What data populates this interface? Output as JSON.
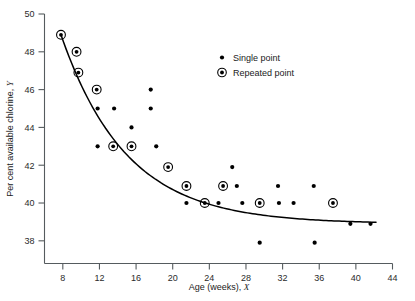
{
  "chart_data": {
    "type": "scatter",
    "title": "",
    "xlabel": "Age (weeks), X",
    "ylabel": "Per cent available chlorine, Y",
    "xlim": [
      6,
      44
    ],
    "ylim": [
      36.8,
      50
    ],
    "grid": false,
    "xticks": [
      8,
      12,
      16,
      20,
      24,
      28,
      32,
      36,
      40,
      44
    ],
    "yticks": [
      38,
      40,
      42,
      44,
      46,
      48,
      50
    ],
    "xticklabels": [
      "8",
      "12",
      "16",
      "20",
      "24",
      "28",
      "32",
      "36",
      "40",
      "44"
    ],
    "yticklabels": [
      "38",
      "40",
      "42",
      "44",
      "46",
      "48",
      "50"
    ],
    "legend": {
      "position": "upper-right-inside",
      "entries": [
        {
          "label": "Single point",
          "marker": "dot"
        },
        {
          "label": "Repeated point",
          "marker": "dot-in-circle"
        }
      ]
    },
    "series": [
      {
        "name": "Single point",
        "marker": "dot",
        "points": [
          [
            11.8,
            45.0
          ],
          [
            11.8,
            43.0
          ],
          [
            13.6,
            45.0
          ],
          [
            15.5,
            44.0
          ],
          [
            17.6,
            46.0
          ],
          [
            17.6,
            45.0
          ],
          [
            18.2,
            43.0
          ],
          [
            21.5,
            40.0
          ],
          [
            25.0,
            40.0
          ],
          [
            26.5,
            41.9
          ],
          [
            27.0,
            40.9
          ],
          [
            27.6,
            40.0
          ],
          [
            29.5,
            37.9
          ],
          [
            31.5,
            40.9
          ],
          [
            31.6,
            40.0
          ],
          [
            33.2,
            40.0
          ],
          [
            35.4,
            40.9
          ],
          [
            35.5,
            37.9
          ],
          [
            39.4,
            38.9
          ],
          [
            41.6,
            38.9
          ]
        ]
      },
      {
        "name": "Repeated point",
        "marker": "dot-in-circle",
        "points": [
          [
            7.8,
            48.9
          ],
          [
            9.5,
            48.0
          ],
          [
            9.7,
            46.9
          ],
          [
            11.7,
            46.0
          ],
          [
            13.5,
            43.0
          ],
          [
            15.5,
            43.0
          ],
          [
            19.5,
            41.9
          ],
          [
            21.5,
            40.9
          ],
          [
            23.5,
            40.0
          ],
          [
            25.5,
            40.9
          ],
          [
            29.5,
            40.0
          ],
          [
            37.5,
            40.0
          ]
        ]
      }
    ],
    "fit_curve": {
      "name": "fitted exponential curve",
      "model": "Y = 39.0 + 17.0 * exp(-0.14 * X)",
      "asymptote": 38.9,
      "x_range": [
        7.8,
        42.2
      ]
    }
  }
}
